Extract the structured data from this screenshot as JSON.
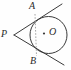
{
  "figure": {
    "type": "geometry-diagram",
    "background_color": "#fefefe",
    "stroke_color": "#3a3a3a",
    "chord_color": "#9a9a9a",
    "labels": {
      "external_point": "P",
      "upper_tangent_point": "A",
      "lower_tangent_point": "B",
      "center": "O"
    },
    "points": {
      "P": {
        "x": 14,
        "y": 35
      },
      "A": {
        "x": 35,
        "y": 14
      },
      "B": {
        "x": 36.5,
        "y": 56
      },
      "O": {
        "x": 48.5,
        "y": 35
      }
    },
    "circle": {
      "cx": 48.5,
      "cy": 35,
      "r": 18.5
    },
    "tangent_upper": {
      "x1": 14,
      "y1": 35,
      "x2": 62,
      "y2": 4
    },
    "tangent_lower": {
      "x1": 14,
      "y1": 35,
      "x2": 64,
      "y2": 65
    },
    "chord": {
      "x1": 35,
      "y1": 14,
      "x2": 36.5,
      "y2": 56
    }
  }
}
